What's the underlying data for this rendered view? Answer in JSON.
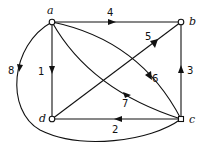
{
  "diagram": {
    "type": "directed-weighted-graph",
    "nodes": [
      {
        "id": "a",
        "label": "a"
      },
      {
        "id": "b",
        "label": "b"
      },
      {
        "id": "c",
        "label": "c"
      },
      {
        "id": "d",
        "label": "d"
      }
    ],
    "edges": [
      {
        "from": "a",
        "to": "d",
        "label": "1"
      },
      {
        "from": "c",
        "to": "d",
        "label": "2"
      },
      {
        "from": "c",
        "to": "b",
        "label": "3"
      },
      {
        "from": "a",
        "to": "b",
        "label": "4"
      },
      {
        "from": "d",
        "to": "b",
        "label": "5"
      },
      {
        "from": "a",
        "to": "c",
        "label": "6"
      },
      {
        "from": "a",
        "to": "c",
        "label": "7"
      },
      {
        "from": "a",
        "to": "c",
        "label": "8"
      }
    ]
  }
}
